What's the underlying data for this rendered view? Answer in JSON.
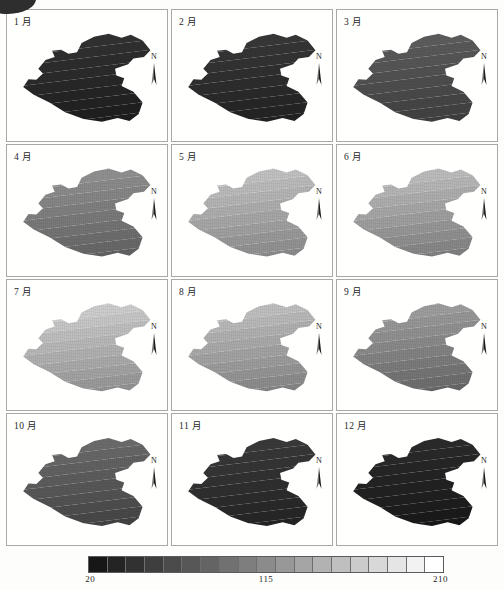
{
  "figure": {
    "type": "map-grid",
    "rows": 4,
    "columns": 3,
    "panel_count": 12
  },
  "corner_artifact": {
    "name": "scan-blob",
    "color": "#2e2e2e"
  },
  "panels": [
    {
      "label": "1 月",
      "month_index": 1,
      "north_arrow": "N",
      "tone_min": 26,
      "tone_max": 52
    },
    {
      "label": "2 月",
      "month_index": 2,
      "north_arrow": "N",
      "tone_min": 30,
      "tone_max": 58
    },
    {
      "label": "3 月",
      "month_index": 3,
      "north_arrow": "N",
      "tone_min": 58,
      "tone_max": 96
    },
    {
      "label": "4 月",
      "month_index": 4,
      "north_arrow": "N",
      "tone_min": 92,
      "tone_max": 150
    },
    {
      "label": "5 月",
      "month_index": 5,
      "north_arrow": "N",
      "tone_min": 132,
      "tone_max": 200
    },
    {
      "label": "6 月",
      "month_index": 6,
      "north_arrow": "N",
      "tone_min": 120,
      "tone_max": 196
    },
    {
      "label": "7 月",
      "month_index": 7,
      "north_arrow": "N",
      "tone_min": 140,
      "tone_max": 212
    },
    {
      "label": "8 月",
      "month_index": 8,
      "north_arrow": "N",
      "tone_min": 126,
      "tone_max": 198
    },
    {
      "label": "9 月",
      "month_index": 9,
      "north_arrow": "N",
      "tone_min": 96,
      "tone_max": 164
    },
    {
      "label": "10 月",
      "month_index": 10,
      "north_arrow": "N",
      "tone_min": 62,
      "tone_max": 112
    },
    {
      "label": "11 月",
      "month_index": 11,
      "north_arrow": "N",
      "tone_min": 32,
      "tone_max": 60
    },
    {
      "label": "12 月",
      "month_index": 12,
      "north_arrow": "N",
      "tone_min": 22,
      "tone_max": 44
    }
  ],
  "legend": {
    "name": "grayscale-colorbar",
    "orientation": "horizontal",
    "segments": 19,
    "min_label": "20",
    "mid_label": "115",
    "max_label": "210",
    "min_value": 20,
    "mid_value": 115,
    "max_value": 210,
    "ramp_from": "#171717",
    "ramp_to": "#ffffff"
  },
  "chart_data": {
    "type": "heatmap",
    "title": "",
    "xlabel": "",
    "ylabel": "",
    "categories": [
      "1 月",
      "2 月",
      "3 月",
      "4 月",
      "5 月",
      "6 月",
      "7 月",
      "8 月",
      "9 月",
      "10 月",
      "11 月",
      "12 月"
    ],
    "values": [
      39,
      44,
      77,
      121,
      166,
      158,
      176,
      162,
      130,
      87,
      46,
      33
    ],
    "colorbar": {
      "min": 20,
      "mid": 115,
      "max": 210,
      "ticks": [
        20,
        115,
        210
      ],
      "segments": 19,
      "colormap": "gray"
    },
    "legend_position": "bottom",
    "grid": false,
    "note": "Twelve monthly grayscale raster maps of one administrative region; value increases from dark (20) to white (210), with a NE-light / SW-dark spatial gradient in each panel."
  }
}
